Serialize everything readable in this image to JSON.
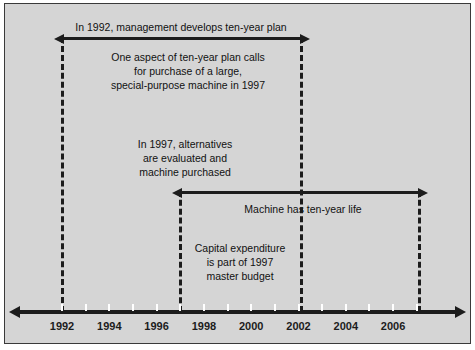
{
  "figure": {
    "type": "timeline-diagram",
    "background_color": "#d5d5d5",
    "border_color": "#3a3a3a",
    "line_color": "#1c1c1c"
  },
  "axis": {
    "name": "year-timeline",
    "start_year": 1991,
    "end_year": 2008,
    "ticks": [
      1992,
      1993,
      1994,
      1995,
      1996,
      1997,
      1998,
      1999,
      2000,
      2001,
      2002,
      2003,
      2004,
      2005,
      2006,
      2007
    ],
    "labels": [
      {
        "year": 1992,
        "text": "1992"
      },
      {
        "year": 1994,
        "text": "1994"
      },
      {
        "year": 1996,
        "text": "1996"
      },
      {
        "year": 1998,
        "text": "1998"
      },
      {
        "year": 2000,
        "text": "2000"
      },
      {
        "year": 2002,
        "text": "2002"
      },
      {
        "year": 2004,
        "text": "2004"
      },
      {
        "year": 2006,
        "text": "2006"
      }
    ]
  },
  "markers": [
    {
      "id": "marker-1992",
      "year": 1992,
      "style": "dashed"
    },
    {
      "id": "marker-1997",
      "year": 1997,
      "style": "dashed"
    },
    {
      "id": "marker-2002",
      "year": 2002,
      "style": "dashed"
    },
    {
      "id": "marker-2007",
      "year": 2007,
      "style": "dashed"
    }
  ],
  "spans": [
    {
      "id": "span-ten-year-plan",
      "from_year": 1992,
      "to_year": 2002,
      "caption": "In 1992, management develops ten-year plan",
      "caption_position": "above"
    },
    {
      "id": "span-machine-life",
      "from_year": 1997,
      "to_year": 2007,
      "caption": "Machine has ten-year life",
      "caption_position": "below"
    }
  ],
  "notes": [
    {
      "id": "note-plan-detail",
      "lines": [
        "One aspect of ten-year plan calls",
        "for purchase of a large,",
        "special-purpose machine in 1997"
      ]
    },
    {
      "id": "note-alternatives",
      "lines": [
        "In 1997, alternatives",
        "are evaluated and",
        "machine purchased"
      ]
    },
    {
      "id": "note-capital-expenditure",
      "lines": [
        "Capital expenditure",
        "is part of 1997",
        "master budget"
      ]
    }
  ]
}
